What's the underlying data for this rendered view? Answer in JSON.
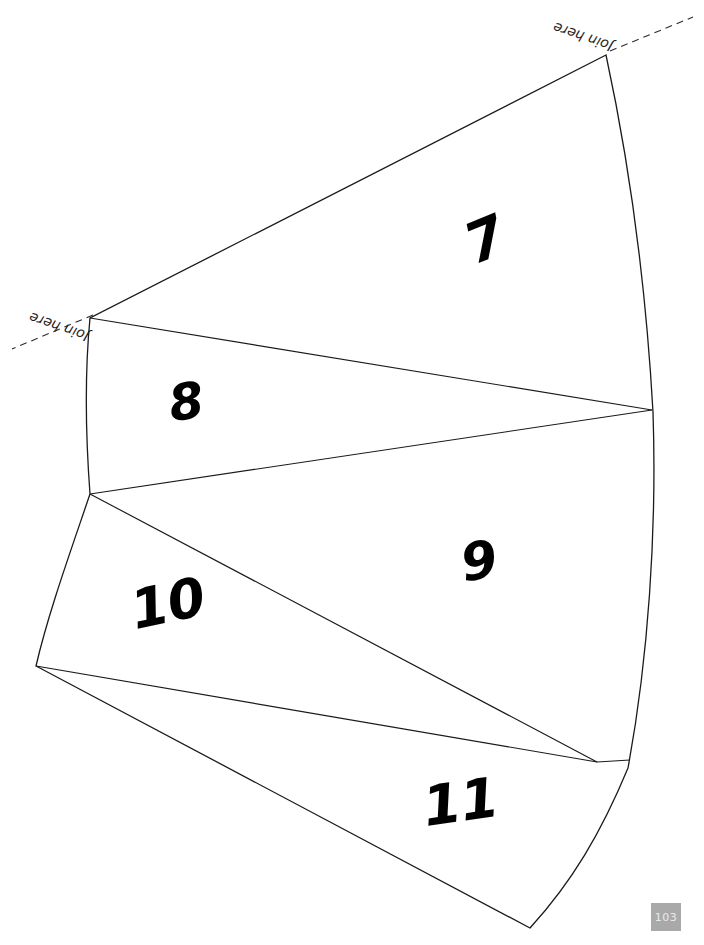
{
  "document": {
    "type": "papercraft-net-template",
    "page_number": "103",
    "background_color": "#ffffff",
    "ink_color": "#1a1a1a",
    "header_cut_off_text": ""
  },
  "faces": [
    {
      "id": "face-7",
      "label": "7",
      "position": {
        "x": 466,
        "y": 212
      },
      "rotation_deg": -22,
      "font_size": 56
    },
    {
      "id": "face-8",
      "label": "8",
      "position": {
        "x": 169,
        "y": 377
      },
      "rotation_deg": -8,
      "font_size": 50
    },
    {
      "id": "face-9",
      "label": "9",
      "position": {
        "x": 461,
        "y": 535
      },
      "rotation_deg": -9,
      "font_size": 52
    },
    {
      "id": "face-10",
      "label": "10",
      "position": {
        "x": 131,
        "y": 577
      },
      "rotation_deg": -12,
      "font_size": 54
    },
    {
      "id": "face-11",
      "label": "11",
      "position": {
        "x": 423,
        "y": 775
      },
      "rotation_deg": -8,
      "font_size": 55
    }
  ],
  "join_tabs": [
    {
      "id": "join-tab-top",
      "label": "Join here",
      "position": {
        "x": 612,
        "y": 40
      },
      "rotation_deg": 199
    },
    {
      "id": "join-tab-left",
      "label": "Join here",
      "position": {
        "x": 88,
        "y": 330
      },
      "rotation_deg": 199
    }
  ],
  "geometry": {
    "vertices": {
      "apex_top": {
        "x": 606,
        "y": 55
      },
      "left_upper": {
        "x": 90,
        "y": 318
      },
      "left_mid": {
        "x": 90,
        "y": 494
      },
      "left_bottom": {
        "x": 36,
        "y": 666
      },
      "right_mid": {
        "x": 652,
        "y": 410
      },
      "right_lower": {
        "x": 597,
        "y": 762
      },
      "bottom_right": {
        "x": 530,
        "y": 928
      }
    },
    "outline_path": "M 606 55 L 90 318 C 84 380 86 440 90 494 C 70 553 48 614 36 666 L 530 928 C 575 880 606 830 632 765 C 652 660 658 530 653 412 C 648 290 632 165 606 55 Z",
    "fold_lines": [
      {
        "from": "left_upper",
        "to": "right_mid"
      },
      {
        "from": "left_mid",
        "to": "right_mid"
      },
      {
        "from": "left_mid",
        "to": "right_lower"
      },
      {
        "from": "left_bottom",
        "to": "right_lower"
      }
    ],
    "tab_dashes": [
      {
        "id": "dash-top",
        "from": {
          "x": 609,
          "y": 52
        },
        "to": {
          "x": 690,
          "y": 19
        }
      },
      {
        "id": "dash-left",
        "from": {
          "x": 93,
          "y": 316
        },
        "to": {
          "x": 14,
          "y": 350
        }
      }
    ]
  },
  "page_badge": {
    "text": "103",
    "background_color": "#a9a9a9",
    "text_color": "#e9e9e9"
  }
}
